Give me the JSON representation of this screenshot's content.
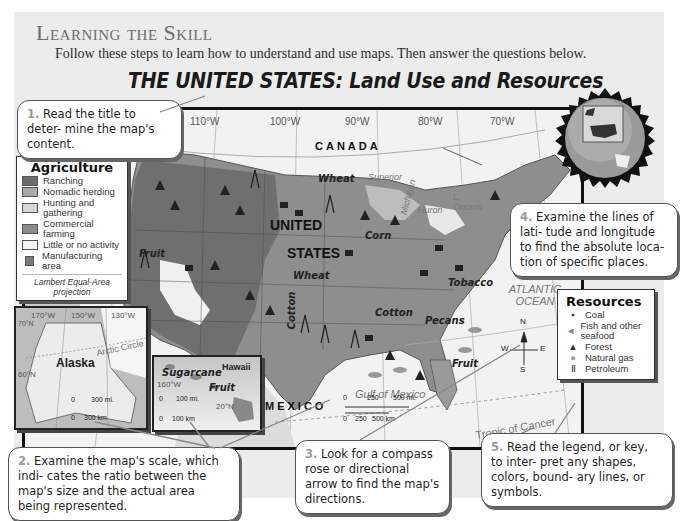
{
  "page": {
    "heading": "Learning the Skill",
    "intro": "Follow these steps to learn how to understand and use maps. Then answer the questions below.",
    "map_title": "THE UNITED STATES: Land Use and Resources"
  },
  "callouts": [
    {
      "num": "1.",
      "text": "Read the title to deter- mine the map's content."
    },
    {
      "num": "2.",
      "text": "Examine the map's scale, which indi- cates the ratio between the map's size and the actual area being represented."
    },
    {
      "num": "3.",
      "text": "Look for a compass rose or directional arrow to find the map's directions."
    },
    {
      "num": "4.",
      "text": "Examine the lines of lati- tude and longitude to find the absolute loca- tion of specific places."
    },
    {
      "num": "5.",
      "text": "Read the legend, or key, to inter- pret any shapes, colors, bound- ary lines, or symbols."
    }
  ],
  "agriculture_legend": {
    "title": "Agriculture",
    "items": [
      {
        "label": "Ranching",
        "color": "#6b6b6b"
      },
      {
        "label": "Nomadic herding",
        "color": "#a9a9a9"
      },
      {
        "label": "Hunting and gathering",
        "color": "#d6d6d6"
      },
      {
        "label": "Commercial farming",
        "color": "#8c8c8c"
      },
      {
        "label": "Little or no activity",
        "color": "#f5f5f5"
      },
      {
        "label": "Manufacturing area",
        "color": "#7a7a7a"
      }
    ],
    "projection": "Lambert Equal-Area projection"
  },
  "resources_legend": {
    "title": "Resources",
    "items": [
      {
        "icon": "coal-icon",
        "label": "Coal"
      },
      {
        "icon": "fish-icon",
        "label": "Fish and other seafood"
      },
      {
        "icon": "forest-icon",
        "label": "Forest"
      },
      {
        "icon": "natural-gas-icon",
        "label": "Natural gas"
      },
      {
        "icon": "petroleum-icon",
        "label": "Petroleum"
      }
    ]
  },
  "map": {
    "longitudes": [
      "120°W",
      "110°W",
      "100°W",
      "90°W",
      "80°W",
      "70°W"
    ],
    "latitude": "30°N",
    "countries": {
      "north": "CANADA",
      "south": "MEXICO",
      "main_line1": "UNITED",
      "main_line2": "STATES"
    },
    "oceans": {
      "atlantic": "ATLANTIC OCEAN",
      "pacific_partial": "OCEAN",
      "gulf": "Gulf of Mexico"
    },
    "lakes": {
      "superior": "Superior",
      "michigan": "Michigan",
      "huron": "Huron",
      "ontario": "L. Ontario"
    },
    "crops": [
      "Wheat",
      "Corn",
      "Wheat",
      "Fruit",
      "Tobacco",
      "Cotton",
      "Cotton",
      "Pecans",
      "Fruit"
    ],
    "tropic": "Tropic of Cancer",
    "scale": {
      "mi_0": "0",
      "mi_250": "250",
      "mi_500": "500 mi.",
      "km_0": "0",
      "km_250": "250",
      "km_500": "500 km"
    },
    "compass": {
      "n": "N",
      "s": "S",
      "e": "E",
      "w": "W"
    }
  },
  "alaska_inset": {
    "label": "Alaska",
    "longitudes": [
      "170°W",
      "150°W",
      "130°W"
    ],
    "latitude": "60°N",
    "lat_top": "70°N",
    "arctic": "Arctic Circle",
    "scale_mi": "300 mi.",
    "scale_km": "300 km",
    "zero": "0"
  },
  "hawaii_inset": {
    "label": "Hawaii",
    "crop1": "Sugarcane",
    "crop2": "Fruit",
    "longitude": "160°W",
    "latitude": "20°N",
    "scale_mi": "100 mi.",
    "scale_km": "100 km",
    "zero": "0"
  }
}
